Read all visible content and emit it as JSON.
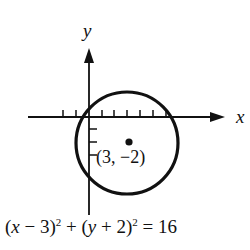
{
  "diagram": {
    "axes": {
      "x_label": "x",
      "y_label": "y",
      "x_ticks_left": 2,
      "x_ticks_right": 6,
      "y_ticks_below": 3
    },
    "circle": {
      "center": [
        3,
        -2
      ],
      "radius": 4
    },
    "center_label": "(3, −2)",
    "equation": {
      "part1_open": "(",
      "part1_var": "x",
      "part1_rest": " − 3)",
      "exp1": "2",
      "plus": " + (",
      "part2_var": "y",
      "part2_rest": " + 2)",
      "exp2": "2",
      "equals": " = 16",
      "full_text": "(x − 3)² + (y + 2)² = 16"
    },
    "colors": {
      "ink": "#111111",
      "background": "#ffffff"
    }
  }
}
